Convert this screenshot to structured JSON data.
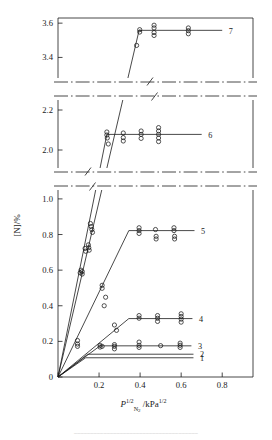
{
  "figure": {
    "top_rule": "",
    "bottom_caption": "──────────────────────────────────────"
  },
  "axes": {
    "ylabel": "[N]/%",
    "xlabel_base": "P",
    "xlabel_sub": "N",
    "xlabel_sub2": "2",
    "xlabel_sup": "1/2",
    "xlabel_unit": "/kPa",
    "xlabel_unit_sup": "1/2",
    "x_ticks": [
      "0",
      "0.2",
      "0.4",
      "0.6",
      "0.8"
    ],
    "x_tick_values": [
      0,
      0.2,
      0.4,
      0.6,
      0.8
    ],
    "x_range": [
      0,
      0.95
    ],
    "panel_top_ticks": [
      "3.6",
      "3.4"
    ],
    "panel_top_values": [
      3.6,
      3.4
    ],
    "panel_top_range": [
      3.28,
      3.63
    ],
    "panel_mid_ticks": [
      "2.2",
      "2.0"
    ],
    "panel_mid_values": [
      2.2,
      2.0
    ],
    "panel_mid_range": [
      1.91,
      2.25
    ],
    "panel_bot_ticks": [
      "1.0",
      "0.8",
      "0.6",
      "0.4",
      "0.2",
      "0"
    ],
    "panel_bot_values": [
      1.0,
      0.8,
      0.6,
      0.4,
      0.2,
      0
    ],
    "panel_bot_range": [
      0,
      1.05
    ],
    "break_symbol": "//"
  },
  "chart_data": {
    "type": "scatter",
    "title": "",
    "xlabel": "P_N2^{1/2} / kPa^{1/2}",
    "ylabel": "[N] / %",
    "grid": false,
    "legend": "inline curve numbers at right end of each plateau",
    "marker": "open circle",
    "note": "Sieverts-law nitrogen solubility: linear rise to saturation then horizontal plateau; y-axis broken twice (dash-dot breaks) into three panels",
    "series": [
      {
        "name": "1",
        "label": "1",
        "plateau": 0.108,
        "knee_x": 0.135,
        "end_x": 0.66,
        "slope": 0.8,
        "points": []
      },
      {
        "name": "2",
        "label": "2",
        "plateau": 0.128,
        "knee_x": 0.145,
        "end_x": 0.66,
        "slope": 0.883,
        "points": []
      },
      {
        "name": "3",
        "label": "3",
        "plateau": 0.175,
        "knee_x": 0.205,
        "end_x": 0.65,
        "slope": 0.854,
        "points": [
          {
            "x": 0.205,
            "y": 0.178
          },
          {
            "x": 0.205,
            "y": 0.168
          },
          {
            "x": 0.215,
            "y": 0.172
          },
          {
            "x": 0.275,
            "y": 0.182
          },
          {
            "x": 0.275,
            "y": 0.172
          },
          {
            "x": 0.275,
            "y": 0.158
          },
          {
            "x": 0.395,
            "y": 0.196
          },
          {
            "x": 0.395,
            "y": 0.178
          },
          {
            "x": 0.395,
            "y": 0.166
          },
          {
            "x": 0.5,
            "y": 0.176
          },
          {
            "x": 0.595,
            "y": 0.19
          },
          {
            "x": 0.595,
            "y": 0.178
          },
          {
            "x": 0.595,
            "y": 0.166
          }
        ]
      },
      {
        "name": "4",
        "label": "4",
        "plateau": 0.328,
        "knee_x": 0.345,
        "end_x": 0.655,
        "slope": 0.951,
        "points": [
          {
            "x": 0.095,
            "y": 0.205
          },
          {
            "x": 0.095,
            "y": 0.185
          },
          {
            "x": 0.095,
            "y": 0.172
          },
          {
            "x": 0.275,
            "y": 0.292
          },
          {
            "x": 0.285,
            "y": 0.262
          },
          {
            "x": 0.395,
            "y": 0.345
          },
          {
            "x": 0.395,
            "y": 0.33
          },
          {
            "x": 0.485,
            "y": 0.345
          },
          {
            "x": 0.485,
            "y": 0.33
          },
          {
            "x": 0.485,
            "y": 0.312
          },
          {
            "x": 0.6,
            "y": 0.355
          },
          {
            "x": 0.6,
            "y": 0.34
          },
          {
            "x": 0.6,
            "y": 0.325
          },
          {
            "x": 0.6,
            "y": 0.308
          }
        ]
      },
      {
        "name": "5",
        "label": "5",
        "plateau": 0.822,
        "knee_x": 0.345,
        "end_x": 0.665,
        "slope": 2.38,
        "points": [
          {
            "x": 0.215,
            "y": 0.515
          },
          {
            "x": 0.215,
            "y": 0.498
          },
          {
            "x": 0.232,
            "y": 0.448
          },
          {
            "x": 0.225,
            "y": 0.4
          },
          {
            "x": 0.395,
            "y": 0.838
          },
          {
            "x": 0.395,
            "y": 0.822
          },
          {
            "x": 0.395,
            "y": 0.806
          },
          {
            "x": 0.475,
            "y": 0.828
          },
          {
            "x": 0.478,
            "y": 0.79
          },
          {
            "x": 0.478,
            "y": 0.775
          },
          {
            "x": 0.565,
            "y": 0.838
          },
          {
            "x": 0.565,
            "y": 0.822
          },
          {
            "x": 0.568,
            "y": 0.79
          },
          {
            "x": 0.568,
            "y": 0.775
          }
        ]
      },
      {
        "name": "6",
        "label": "6",
        "plateau": 2.078,
        "knee_x": 0.238,
        "end_x": 0.7,
        "points": [
          {
            "x": 0.108,
            "y": 0.585
          },
          {
            "x": 0.112,
            "y": 0.6
          },
          {
            "x": 0.118,
            "y": 0.578
          },
          {
            "x": 0.118,
            "y": 0.592
          },
          {
            "x": 0.132,
            "y": 0.722
          },
          {
            "x": 0.135,
            "y": 0.706
          },
          {
            "x": 0.148,
            "y": 0.742
          },
          {
            "x": 0.15,
            "y": 0.726
          },
          {
            "x": 0.152,
            "y": 0.712
          },
          {
            "x": 0.158,
            "y": 0.862
          },
          {
            "x": 0.162,
            "y": 0.845
          },
          {
            "x": 0.165,
            "y": 0.828
          },
          {
            "x": 0.168,
            "y": 0.812
          },
          {
            "x": 0.238,
            "y": 2.09
          },
          {
            "x": 0.238,
            "y": 2.075
          },
          {
            "x": 0.24,
            "y": 2.06
          },
          {
            "x": 0.245,
            "y": 2.03
          },
          {
            "x": 0.318,
            "y": 2.085
          },
          {
            "x": 0.318,
            "y": 2.062
          },
          {
            "x": 0.318,
            "y": 2.045
          },
          {
            "x": 0.405,
            "y": 2.095
          },
          {
            "x": 0.405,
            "y": 2.078
          },
          {
            "x": 0.405,
            "y": 2.058
          },
          {
            "x": 0.49,
            "y": 2.112
          },
          {
            "x": 0.49,
            "y": 2.095
          },
          {
            "x": 0.49,
            "y": 2.078
          },
          {
            "x": 0.49,
            "y": 2.06
          },
          {
            "x": 0.49,
            "y": 2.042
          }
        ]
      },
      {
        "name": "7",
        "label": "7",
        "plateau": 3.558,
        "knee_x": 0.395,
        "end_x": 0.8,
        "points": [
          {
            "x": 0.383,
            "y": 3.47
          },
          {
            "x": 0.398,
            "y": 3.562
          },
          {
            "x": 0.398,
            "y": 3.548
          },
          {
            "x": 0.468,
            "y": 3.588
          },
          {
            "x": 0.468,
            "y": 3.572
          },
          {
            "x": 0.468,
            "y": 3.545
          },
          {
            "x": 0.468,
            "y": 3.528
          },
          {
            "x": 0.635,
            "y": 3.572
          },
          {
            "x": 0.635,
            "y": 3.556
          },
          {
            "x": 0.635,
            "y": 3.538
          }
        ]
      }
    ]
  }
}
